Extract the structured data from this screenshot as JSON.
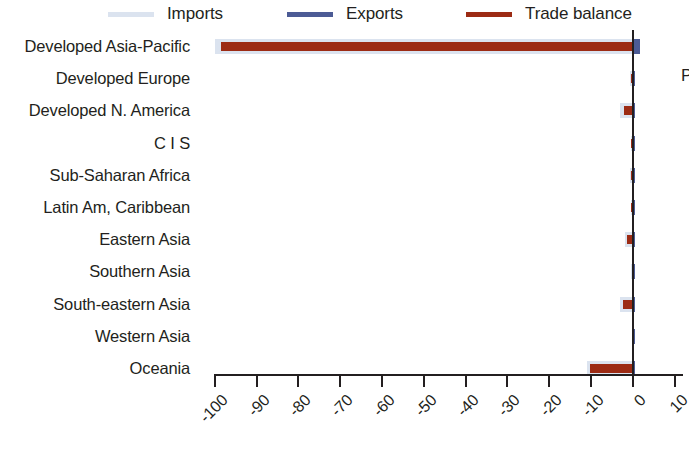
{
  "legend": {
    "items": [
      {
        "label": "Imports",
        "color": "#dbe3ef",
        "name": "legend-imports"
      },
      {
        "label": "Exports",
        "color": "#4c5b95",
        "name": "legend-exports"
      },
      {
        "label": "Trade balance",
        "color": "#9c2b14",
        "name": "legend-balance"
      }
    ]
  },
  "edge_note": {
    "text": "P"
  },
  "chart_data": {
    "type": "bar",
    "orientation": "horizontal",
    "title": "",
    "xlabel": "",
    "ylabel": "",
    "xlim": [
      -104,
      12
    ],
    "xticks": [
      -100,
      -90,
      -80,
      -70,
      -60,
      -50,
      -40,
      -30,
      -20,
      -10,
      0,
      10
    ],
    "xtick_labels": [
      "-100",
      "-90",
      "-80",
      "-70",
      "-60",
      "-50",
      "-40",
      "-30",
      "-20",
      "-10",
      "0",
      "10"
    ],
    "grid": false,
    "legend_position": "top",
    "categories": [
      "Developed Asia-Pacific",
      "Developed Europe",
      "Developed N. America",
      "C I S",
      "Sub-Saharan Africa",
      "Latin Am, Caribbean",
      "Eastern Asia",
      "Southern Asia",
      "South-eastern Asia",
      "Western Asia",
      "Oceania"
    ],
    "series": [
      {
        "name": "Imports",
        "color": "#dbe3ef",
        "values": [
          -100.0,
          -0.6,
          -3.0,
          -0.5,
          -0.6,
          -0.5,
          -1.9,
          -0.4,
          -3.0,
          -0.3,
          -11.0
        ]
      },
      {
        "name": "Exports",
        "color": "#4c5b95",
        "values": [
          1.8,
          0.2,
          0.4,
          0.2,
          0.2,
          0.2,
          0.5,
          0.2,
          0.4,
          0.2,
          0.6
        ]
      },
      {
        "name": "Trade balance",
        "color": "#9c2b14",
        "values": [
          -98.5,
          -0.4,
          -2.0,
          -0.4,
          -0.5,
          -0.4,
          -1.4,
          -0.3,
          -2.4,
          -0.2,
          -10.2
        ]
      }
    ]
  }
}
